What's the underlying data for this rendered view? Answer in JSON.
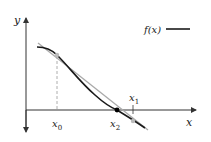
{
  "diagram": {
    "axes": {
      "x_label": "x",
      "y_label": "y"
    },
    "legend": {
      "label": "f(x)"
    },
    "points": {
      "x0": {
        "label": "x",
        "sub": "0"
      },
      "x1": {
        "label": "x",
        "sub": "1"
      },
      "x2": {
        "label": "x",
        "sub": "2"
      }
    },
    "colors": {
      "curve": "#1a1a1a",
      "tangent": "#aaaaaa",
      "axis": "#333333",
      "point_gray": "#bbbbbb",
      "point_root": "#000000"
    }
  }
}
